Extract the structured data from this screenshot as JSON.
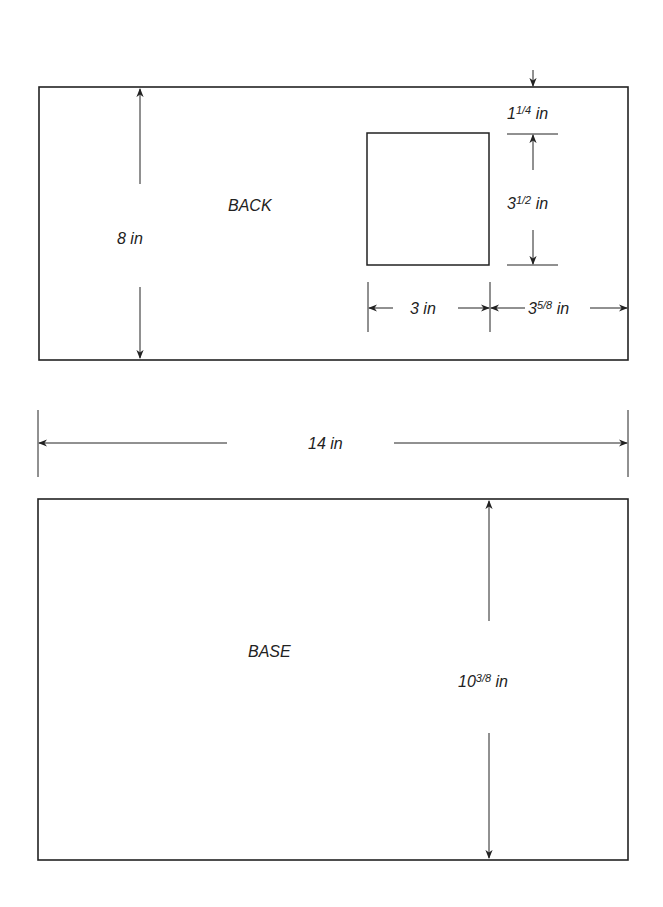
{
  "diagram": {
    "back_panel": {
      "label": "BACK",
      "height_dim": "8 in",
      "cutout": {
        "top_offset": {
          "whole": "1",
          "frac": "1/4",
          "unit": " in"
        },
        "height": {
          "whole": "3",
          "frac": "1/2",
          "unit": " in"
        },
        "width": "3 in",
        "right_offset": {
          "whole": "3",
          "frac": "5/8",
          "unit": " in"
        }
      }
    },
    "width_dim": "14 in",
    "base_panel": {
      "label": "BASE",
      "height_dim": {
        "whole": "10",
        "frac": "3/8",
        "unit": " in"
      }
    },
    "colors": {
      "line": "#222222",
      "background": "#ffffff"
    }
  }
}
